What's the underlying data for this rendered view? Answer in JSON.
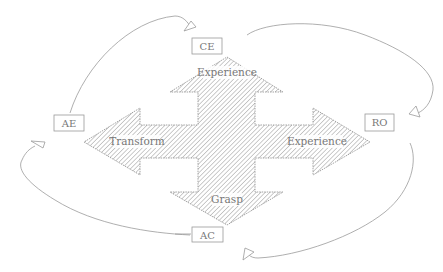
{
  "diagram": {
    "colors": {
      "stroke": "#9a9a9a",
      "hatch": "#8c8c8c",
      "text": "#777777",
      "background": "#ffffff"
    },
    "nodes": [
      {
        "id": "CE",
        "label": "CE"
      },
      {
        "id": "RO",
        "label": "RO"
      },
      {
        "id": "AC",
        "label": "AC"
      },
      {
        "id": "AE",
        "label": "AE"
      }
    ],
    "cross_arrow": {
      "up_label": "Experience",
      "right_label": "Experience",
      "down_label": "Grasp",
      "left_label": "Transform"
    },
    "cycle_edges": [
      {
        "from": "AE",
        "to": "CE"
      },
      {
        "from": "CE",
        "to": "RO"
      },
      {
        "from": "RO",
        "to": "AC"
      },
      {
        "from": "AC",
        "to": "AE"
      }
    ]
  }
}
